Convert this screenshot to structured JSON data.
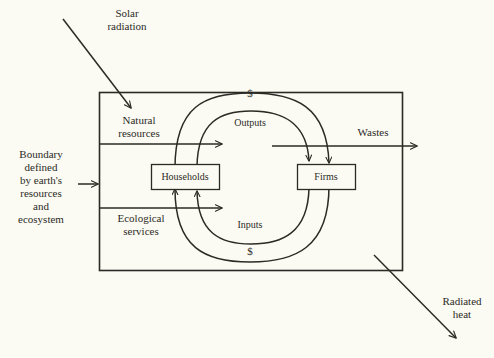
{
  "diagram": {
    "colors": {
      "background": "#fbfaf3",
      "stroke": "#2b2b26",
      "text": "#2b2b26",
      "box_fill": "#fbfaf3"
    },
    "boundary_box": {
      "label": "environment-boundary"
    },
    "external_labels": {
      "solar_radiation": "Solar\nradiation",
      "boundary": "Boundary\ndefined\nby earth's\nresources\nand\necosystem",
      "radiated_heat": "Radiated\nheat",
      "wastes": "Wastes"
    },
    "internal_labels": {
      "natural_resources": "Natural\nresources",
      "ecological_services": "Ecological\nservices"
    },
    "nodes": [
      {
        "id": "households",
        "label": "Households"
      },
      {
        "id": "firms",
        "label": "Firms"
      }
    ],
    "flows": [
      {
        "id": "outputs",
        "label": "Outputs",
        "ring": "inner",
        "position": "top"
      },
      {
        "id": "inputs",
        "label": "Inputs",
        "ring": "inner",
        "position": "bottom"
      },
      {
        "id": "money-top",
        "label": "$",
        "ring": "outer",
        "position": "top"
      },
      {
        "id": "money-bottom",
        "label": "$",
        "ring": "outer",
        "position": "bottom"
      }
    ]
  }
}
